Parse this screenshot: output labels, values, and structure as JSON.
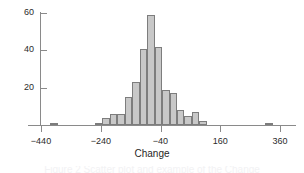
{
  "figure": {
    "background_color": "#ffffff",
    "caption_partial": "Figure 2   Scatter plot and example of the Change"
  },
  "style": {
    "bar_fill": "#c8c8c8",
    "bar_edge": "#7d7d7d",
    "axis_color": "#8a8a8a",
    "text_color": "#2b2b2b"
  },
  "chart_data": {
    "type": "bar",
    "chart_subtype": "histogram",
    "title": "",
    "xlabel": "Change",
    "ylabel": "",
    "xlim": [
      -450,
      370
    ],
    "ylim": [
      0,
      62
    ],
    "grid": false,
    "legend": null,
    "bin_width": 50,
    "x_ticks": [
      -440,
      -240,
      -40,
      160,
      360
    ],
    "x_tick_labels": [
      "-440",
      "-240",
      "-40",
      "160",
      "360"
    ],
    "y_ticks": [
      20,
      40,
      60
    ],
    "y_tick_labels": [
      "20",
      "40",
      "60"
    ],
    "bins": [
      {
        "left": -410,
        "right": -385,
        "center": -398,
        "value": 1
      },
      {
        "left": -260,
        "right": -235,
        "center": -248,
        "value": 1
      },
      {
        "left": -235,
        "right": -210,
        "center": -223,
        "value": 4
      },
      {
        "left": -210,
        "right": -185,
        "center": -198,
        "value": 6
      },
      {
        "left": -185,
        "right": -160,
        "center": -173,
        "value": 6
      },
      {
        "left": -160,
        "right": -135,
        "center": -148,
        "value": 15
      },
      {
        "left": -135,
        "right": -110,
        "center": -123,
        "value": 23
      },
      {
        "left": -110,
        "right": -85,
        "center": -98,
        "value": 41
      },
      {
        "left": -85,
        "right": -60,
        "center": -73,
        "value": 59
      },
      {
        "left": -60,
        "right": -35,
        "center": -48,
        "value": 42
      },
      {
        "left": -35,
        "right": -10,
        "center": -23,
        "value": 19
      },
      {
        "left": -10,
        "right": 15,
        "center": 3,
        "value": 17
      },
      {
        "left": 15,
        "right": 40,
        "center": 28,
        "value": 8
      },
      {
        "left": 40,
        "right": 65,
        "center": 53,
        "value": 5
      },
      {
        "left": 65,
        "right": 90,
        "center": 78,
        "value": 7
      },
      {
        "left": 90,
        "right": 115,
        "center": 103,
        "value": 2
      },
      {
        "left": 310,
        "right": 335,
        "center": 323,
        "value": 1
      }
    ]
  }
}
